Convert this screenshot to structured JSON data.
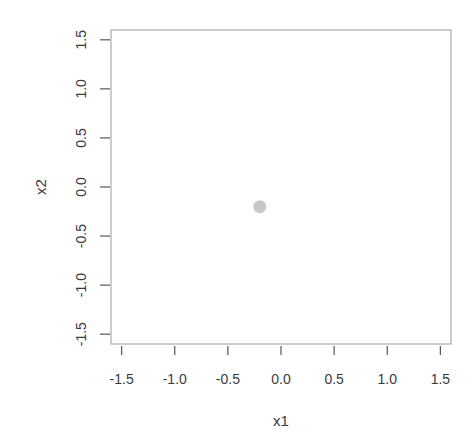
{
  "chart_data": {
    "type": "scatter",
    "title": "",
    "xlabel": "x1",
    "ylabel": "x2",
    "xlim": [
      -1.6,
      1.6
    ],
    "ylim": [
      -1.6,
      1.6
    ],
    "x_ticks": [
      -1.5,
      -1.0,
      -0.5,
      0.0,
      0.5,
      1.0,
      1.5
    ],
    "y_ticks": [
      -1.5,
      -1.0,
      -0.5,
      0.0,
      0.5,
      1.0,
      1.5
    ],
    "x_tick_labels": [
      "-1.5",
      "-1.0",
      "-0.5",
      "0.0",
      "0.5",
      "1.0",
      "1.5"
    ],
    "y_tick_labels": [
      "-1.5",
      "-1.0",
      "-0.5",
      "0.0",
      "0.5",
      "1.0",
      "1.5"
    ],
    "grid": false,
    "legend": null,
    "series": [
      {
        "name": "points",
        "color": "#c8c8c8",
        "points": [
          {
            "x": -0.2,
            "y": -0.2
          }
        ]
      }
    ]
  },
  "colors": {
    "box": "#9a9a9a",
    "ticks": "#555555",
    "point": "#c8c8c8"
  }
}
